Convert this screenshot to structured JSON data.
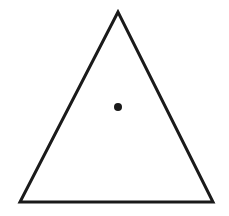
{
  "diagram": {
    "type": "triangle-with-center-point",
    "stroke_color": "#1a1a1a",
    "fill_color": "#ffffff",
    "background": "#ffffff",
    "triangle": {
      "vertices": [
        [
          118,
          12
        ],
        [
          20,
          202
        ],
        [
          213,
          202
        ]
      ],
      "stroke_width": 3
    },
    "center_point": {
      "x": 118,
      "y": 107,
      "radius": 4
    }
  }
}
